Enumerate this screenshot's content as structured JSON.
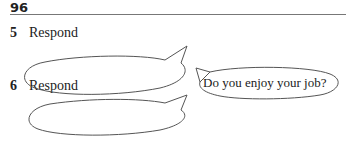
{
  "page": {
    "number": "96"
  },
  "items": [
    {
      "number": "5",
      "label": "Respond"
    },
    {
      "number": "6",
      "label": "Respond"
    }
  ],
  "prompt_bubble": {
    "text": "Do you enjoy your job?"
  }
}
